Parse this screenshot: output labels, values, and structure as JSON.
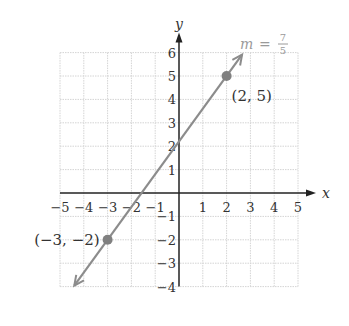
{
  "chart_data": {
    "type": "line",
    "title": "",
    "xlabel": "x",
    "ylabel": "y",
    "xlim": [
      -5,
      5
    ],
    "ylim": [
      -4,
      6
    ],
    "grid": true,
    "x_ticks": [
      -5,
      -4,
      -3,
      -2,
      -1,
      1,
      2,
      3,
      4,
      5
    ],
    "x_tick_labels": [
      "−5",
      "−4",
      "−3",
      "−2",
      "−1",
      "1",
      "2",
      "3",
      "4",
      "5"
    ],
    "y_ticks": [
      -4,
      -3,
      -2,
      -1,
      1,
      2,
      3,
      4,
      5,
      6
    ],
    "y_tick_labels": [
      "−4",
      "−3",
      "−2",
      "−1",
      "1",
      "2",
      "3",
      "4",
      "5",
      "6"
    ],
    "series": [
      {
        "name": "line",
        "slope": 1.4,
        "intercept": 2.2,
        "x_range": [
          -4.4,
          2.65
        ],
        "arrows": "both",
        "color": "#8c8c8c"
      }
    ],
    "points": [
      {
        "x": -3,
        "y": -2,
        "label": "(−3, −2)",
        "label_side": "left"
      },
      {
        "x": 2,
        "y": 5,
        "label": "(2, 5)",
        "label_side": "below-right"
      }
    ],
    "annotations": [
      {
        "text_var": "m",
        "text_eq": "=",
        "numerator": "7",
        "denominator": "5",
        "meaning": "slope m = 7/5",
        "position": "top-right"
      }
    ]
  },
  "colors": {
    "axis": "#222222",
    "grid": "#d4d4d4",
    "line": "#8c8c8c",
    "point": "#808080",
    "text": "#333333",
    "annotation": "#9a9a9a"
  }
}
